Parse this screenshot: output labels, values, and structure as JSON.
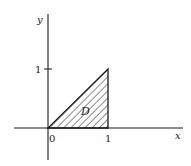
{
  "figure": {
    "axes": {
      "x_label": "x",
      "y_label": "y",
      "origin_label": "0",
      "x_tick_label": "1",
      "y_tick_label": "1"
    },
    "region": {
      "label": "D",
      "vertices": [
        [
          0,
          0
        ],
        [
          1,
          0
        ],
        [
          1,
          1
        ]
      ],
      "fill": "diagonal-hatching"
    },
    "colors": {
      "ink": "#1a1a1a",
      "background": "#ffffff"
    }
  }
}
